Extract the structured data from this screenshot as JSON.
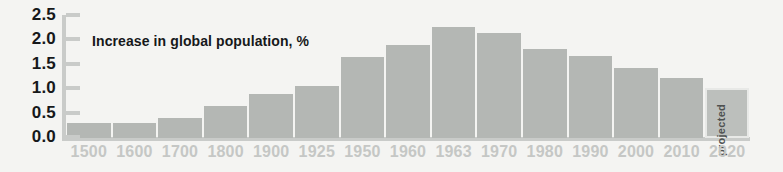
{
  "chart_data": {
    "type": "bar",
    "title": "Increase in global population, %",
    "xlabel": "",
    "ylabel": "",
    "ylim": [
      0.0,
      2.5
    ],
    "grid": false,
    "legend": null,
    "categories": [
      "1500",
      "1600",
      "1700",
      "1800",
      "1900",
      "1925",
      "1950",
      "1960",
      "1963",
      "1970",
      "1980",
      "1990",
      "2000",
      "2010",
      "2020"
    ],
    "values": [
      0.3,
      0.3,
      0.4,
      0.65,
      0.9,
      1.07,
      1.65,
      1.9,
      2.28,
      2.15,
      1.83,
      1.68,
      1.43,
      1.22,
      1.02
    ],
    "y_ticks": [
      "0.0",
      "0.5",
      "1.0",
      "1.5",
      "2.0",
      "2.5"
    ],
    "y_tick_values": [
      0.0,
      0.5,
      1.0,
      1.5,
      2.0,
      2.5
    ],
    "annotations": [
      {
        "category": "2020",
        "text": "projected",
        "orientation": "vertical"
      }
    ],
    "colors": {
      "background": "#f4f4f2",
      "bar": "#b4b7b4",
      "bar_projected": "#bcbfbc",
      "axis": "#c9cbc9",
      "y_label_text": "#16181a",
      "x_label_text": "#c5c7c5",
      "title_text": "#16181a"
    }
  }
}
